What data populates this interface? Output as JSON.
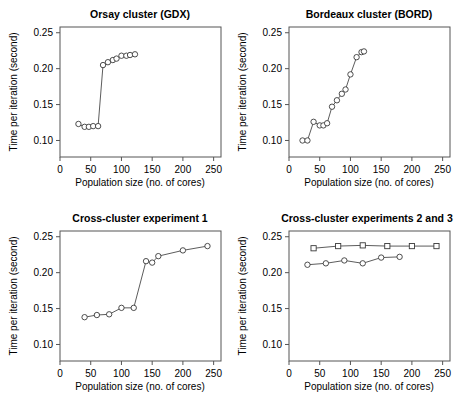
{
  "figure": {
    "background_color": "#ffffff",
    "line_color": "#4a4a4a",
    "marker_edge_color": "#3a3a3a",
    "axis_color": "#555555"
  },
  "common": {
    "xlabel": "Population size (no. of cores)",
    "ylabel": "Time per iteration (second)",
    "xticks": [
      "0",
      "50",
      "100",
      "150",
      "200",
      "250"
    ],
    "yticks": [
      "0.10",
      "0.15",
      "0.20",
      "0.25"
    ]
  },
  "chart_data": [
    {
      "type": "scatter",
      "panel": "top-left",
      "title": "Orsay cluster (GDX)",
      "xlabel": "Population size (no. of cores)",
      "ylabel": "Time per iteration (second)",
      "xlim": [
        0,
        262
      ],
      "ylim": [
        0.077,
        0.258
      ],
      "xticks": [
        0,
        50,
        100,
        150,
        200,
        250
      ],
      "yticks": [
        0.1,
        0.15,
        0.2,
        0.25
      ],
      "grid": false,
      "legend": "none",
      "series": [
        {
          "name": "GDX",
          "marker": "circle",
          "x": [
            30,
            40,
            47,
            54,
            62,
            70,
            78,
            86,
            92,
            100,
            108,
            114,
            122
          ],
          "y": [
            0.123,
            0.119,
            0.119,
            0.12,
            0.12,
            0.205,
            0.209,
            0.212,
            0.214,
            0.218,
            0.218,
            0.219,
            0.22
          ]
        }
      ]
    },
    {
      "type": "scatter",
      "panel": "top-right",
      "title": "Bordeaux cluster (BORD)",
      "xlabel": "Population size (no. of cores)",
      "ylabel": "Time per iteration (second)",
      "xlim": [
        0,
        262
      ],
      "ylim": [
        0.077,
        0.258
      ],
      "xticks": [
        0,
        50,
        100,
        150,
        200,
        250
      ],
      "yticks": [
        0.1,
        0.15,
        0.2,
        0.25
      ],
      "grid": false,
      "legend": "none",
      "series": [
        {
          "name": "BORD",
          "marker": "circle",
          "x": [
            22,
            30,
            40,
            50,
            56,
            62,
            70,
            78,
            86,
            92,
            100,
            110,
            118,
            122
          ],
          "y": [
            0.1,
            0.1,
            0.126,
            0.121,
            0.121,
            0.124,
            0.147,
            0.156,
            0.165,
            0.171,
            0.192,
            0.216,
            0.223,
            0.224
          ]
        }
      ]
    },
    {
      "type": "scatter",
      "panel": "bottom-left",
      "title": "Cross-cluster experiment 1",
      "xlabel": "Population size (no. of cores)",
      "ylabel": "Time per iteration (second)",
      "xlim": [
        0,
        262
      ],
      "ylim": [
        0.077,
        0.258
      ],
      "xticks": [
        0,
        50,
        100,
        150,
        200,
        250
      ],
      "yticks": [
        0.1,
        0.15,
        0.2,
        0.25
      ],
      "grid": false,
      "legend": "none",
      "series": [
        {
          "name": "Experiment 1",
          "marker": "circle",
          "x": [
            40,
            60,
            80,
            100,
            120,
            140,
            150,
            160,
            200,
            240
          ],
          "y": [
            0.138,
            0.141,
            0.142,
            0.151,
            0.151,
            0.216,
            0.214,
            0.223,
            0.231,
            0.237
          ]
        }
      ]
    },
    {
      "type": "scatter",
      "panel": "bottom-right",
      "title": "Cross-cluster experiments 2 and 3",
      "xlabel": "Population size (no. of cores)",
      "ylabel": "Time per iteration (second)",
      "xlim": [
        0,
        262
      ],
      "ylim": [
        0.077,
        0.258
      ],
      "xticks": [
        0,
        50,
        100,
        150,
        200,
        250
      ],
      "yticks": [
        0.1,
        0.15,
        0.2,
        0.25
      ],
      "grid": false,
      "legend": "none",
      "series": [
        {
          "name": "Experiment 3",
          "marker": "square",
          "x": [
            40,
            80,
            120,
            160,
            200,
            240
          ],
          "y": [
            0.234,
            0.237,
            0.238,
            0.237,
            0.237,
            0.237
          ]
        },
        {
          "name": "Experiment 2",
          "marker": "circle",
          "x": [
            30,
            60,
            90,
            120,
            150,
            180
          ],
          "y": [
            0.211,
            0.213,
            0.217,
            0.213,
            0.221,
            0.222
          ]
        }
      ]
    }
  ]
}
